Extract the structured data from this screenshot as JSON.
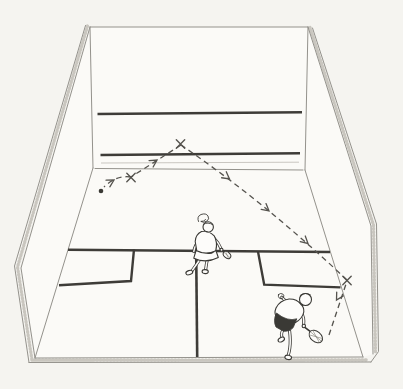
{
  "colors": {
    "paper": "#f5f4f0",
    "surface": "#fbfaf7",
    "floor": "#fbfaf7",
    "edge": "#94928c",
    "faint": "#bcb9b2",
    "stipple": "#c9c6bf",
    "heavy": "#3e3c38",
    "ink": "#3a3935",
    "dash": "#55534e",
    "figure": "#fdfcfa"
  },
  "canvas": {
    "viewBox": "0 0 403 389"
  },
  "court": {
    "fills": {
      "front_wall": "M90,27 L308,27 L305,170 L93,168 Z",
      "left_wall": "M90,27 L93,168 L35,358 L21,268 Z",
      "right_wall": "M308,27 L305,170 L363,357 L373,354 L371,226 Z",
      "floor": "M93,168 L305,170 L363,357 L35,358 Z"
    },
    "edges": {
      "front_top": "M90,27 L308,27",
      "front_left": "M90,27 L93,168",
      "front_right": "M308,27 L305,170",
      "front_floor_junction": "M95,168.5 L303,170",
      "tin_bottom": "M101,163 L299,162.2",
      "left_rim": "M90,27 L21,268 L35,358",
      "left_outer": "M85.5,25.5 L14.5,266 L29,362.5",
      "left_stipple": "M87.5,26 L17.5,267 L32,360",
      "left_floor_junction": "M93,168 L35,358",
      "right_rim": "M308,27 L371,226 L373,354",
      "right_outer": "M312.5,28 L376.5,224 L378.5,351.5 L371,362",
      "right_stipple": "M310,27.5 L373.5,225 L375.5,352",
      "right_floor_junction": "M305,170 L363,357",
      "floor_near_edge": "M35,358 L363,357",
      "floor_outer_edge": "M29,362.5 L371,362",
      "floor_stipple": "M32,360.2 L367,359.8"
    },
    "lines": {
      "service_line": "M97.5,114 L302,112.2",
      "tin_line": "M100.5,155 L300,153.2",
      "short_line": "M68,249.8 L330,252",
      "half_court_line": "M196.2,253 L197.2,357",
      "left_service_box": "M134,249.3 L131,281 L59,285.2",
      "right_service_box": "M258,251.6 L264.2,284.6 L340.5,287.4"
    }
  },
  "trajectory": {
    "segments": {
      "strike_to_side_wall": "M329,335 L347,281",
      "side_wall_to_front_wall": "M347,280 Q264,201.5 181,145",
      "front_wall_to_floor": "M181,145 L131,177",
      "floor_rollout": "M131,177 Q116,175 104,187"
    },
    "x_mark_shape": "M-4.2,-4.2 L4.2,4.2 M4.2,-4.2 L-4.2,4.2",
    "impact_marks": [
      {
        "transform": "translate(347,280.5)"
      },
      {
        "transform": "translate(180.5,144)"
      },
      {
        "transform": "translate(131,177.5)"
      }
    ],
    "arrow_shape": "M7,-3.8 L0,0 L7,3.8",
    "arrows": [
      {
        "transform": "translate(336.5,300) rotate(-60)"
      },
      {
        "transform": "translate(308,243.5) rotate(-138.5)"
      },
      {
        "transform": "translate(269,211) rotate(-140.5)"
      },
      {
        "transform": "translate(229.5,179) rotate(-142.5)"
      },
      {
        "transform": "translate(157,160) rotate(147.5)"
      },
      {
        "transform": "translate(114,180) rotate(150)"
      }
    ],
    "ball": {
      "cx": "101",
      "cy": "191",
      "r": "2.3"
    }
  },
  "players": {
    "receiver": {
      "limbs": "M213.5,237.5 Q219,243 221.3,249.2 M199.5,239.5 Q194.5,246 193.8,251.5 M201.2,257.5 Q196.5,264.5 192,270.8 M207.6,258 Q206.2,264.5 205.6,269.8",
      "body": "M201.5,231.5 Q195.5,234.5 195.2,241.5 L196.8,250.8 Q204,254.2 211.5,253.2 L215.8,250.5 Q217.8,242.5 214.2,235.8 Q208.5,230.2 201.5,231.5 Z M196,250.5 Q205.5,255.5 216,250.8 L218.3,257.5 Q206,263.8 193.8,258.2 Z M203,227 a5.2,5.2 0 1 0 10.4,0 a5.2,5.2 0 1 0 -10.4,0",
      "hair_bun": "M198.5,221.5 Q196.5,216.5 201,214.5 Q206,212.8 208,216 Q209.8,219 206.8,221.2 Q203.5,223.2 200.8,221.4 Q203.8,221.8 205.6,219.6",
      "hair_fringe": "M203.4,224.2 Q208,221.6 212.6,224.6",
      "hand": {
        "cx": "221.5",
        "cy": "249.8",
        "r": "1.5"
      },
      "shoe_left": {
        "transform": "translate(189.3,272.6) rotate(-18)",
        "rx": "3.5",
        "ry": "2.1"
      },
      "shoe_right": {
        "transform": "translate(205.2,271.6) rotate(4)",
        "rx": "3.1",
        "ry": "2"
      },
      "racquet_handle": "M220.8,248.8 L224.2,252.2",
      "racquet_head": {
        "transform": "translate(227,255) rotate(42)",
        "rx": "4.2",
        "ry": "3"
      },
      "racquet_strings": "M224.2,252.6 L229.8,257.4 M225.6,251.6 L228.4,258.2"
    },
    "striker": {
      "limbs": "M288.5,303.5 Q284,299.5 281.8,297.2 M300.8,311.5 Q304.6,317.5 303.6,324.8 M283.2,329.5 Q280.4,333.8 282.2,337.8 M289.6,331 Q290.8,341 289.8,348 Q289.2,352.5 288.2,355.2",
      "body": "M300.5,304 Q297,298.8 289,299 Q279.5,300.5 276,308 Q273.8,313.5 276.5,317 L295.5,322.5 Q302.5,318.5 303.8,312 Q304.3,307 300.5,304 Z M299.5,299.5 a6,6 0 1 0 12,0 a6,6 0 1 0 -12,0",
      "shorts": "M276.5,313 Q272.8,320.5 276,327 L283.5,331.2 Q289.5,331.8 293.2,327.6 L296.8,318.8 Q287.5,322 276.5,313 Z",
      "hair_arc": "M300.2,295.4 Q305,291.6 310.4,294.8",
      "hand_scribble": "M278.4,294.6 Q280.6,292.6 282.8,294 Q284.8,295.6 283.2,297.8 Q281.2,299.6 279.4,298.2 Q277.8,296.6 278.4,294.6",
      "hand": {
        "cx": "303.8",
        "cy": "326",
        "r": "1.7"
      },
      "shoe_back": {
        "transform": "translate(281.3,339.6) rotate(-28)",
        "rx": "3.4",
        "ry": "2.1"
      },
      "shoe_front": {
        "transform": "translate(288.2,357.4) rotate(8)",
        "rx": "3.4",
        "ry": "2.2"
      },
      "racquet_handle": "M304.2,326.8 L309.8,331.2",
      "racquet_head": {
        "transform": "translate(315.8,336.5) rotate(40)",
        "rx": "7.6",
        "ry": "5.2"
      },
      "racquet_strings": "M310.2,331.6 L321.4,341.2 M309,334.8 L322,338.4 M312.6,330 L319.4,342.6"
    }
  }
}
